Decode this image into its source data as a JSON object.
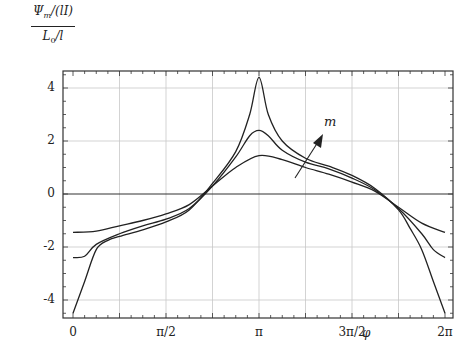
{
  "chart_data": {
    "type": "line",
    "title": "",
    "ylabel_numerator": "Ψm/(lI)",
    "ylabel_denominator": "L0/l",
    "xlabel": "φ",
    "xlim": [
      0,
      2
    ],
    "x_unit": "π",
    "ylim": [
      -4.7,
      4.7
    ],
    "grid": true,
    "x_ticks": [
      {
        "value": 0,
        "label": "0"
      },
      {
        "value": 0.5,
        "label": "π/2"
      },
      {
        "value": 1,
        "label": "π"
      },
      {
        "value": 1.5,
        "label": "3π/2"
      },
      {
        "value": 2,
        "label": "2π"
      }
    ],
    "x_gridlines": [
      0.25,
      0.5,
      0.75,
      1,
      1.25,
      1.5,
      1.75
    ],
    "y_ticks": [
      {
        "value": 4,
        "label": "4"
      },
      {
        "value": 2,
        "label": "2"
      },
      {
        "value": 0,
        "label": "0"
      },
      {
        "value": -2,
        "label": "-2"
      },
      {
        "value": -4,
        "label": "-4"
      }
    ],
    "annotation": {
      "text": "m",
      "meaning": "arrow indicating increasing m"
    },
    "series": [
      {
        "name": "m small",
        "x": [
          0,
          0.125,
          0.25,
          0.375,
          0.5,
          0.625,
          0.75,
          0.875,
          1.0,
          1.125,
          1.25,
          1.375,
          1.5,
          1.625,
          1.75,
          1.875,
          2.0
        ],
        "values": [
          -1.45,
          -1.4,
          -1.2,
          -1.0,
          -0.75,
          -0.4,
          0.3,
          1.0,
          1.45,
          1.3,
          1.0,
          0.75,
          0.45,
          0.1,
          -0.5,
          -1.1,
          -1.45
        ]
      },
      {
        "name": "m medium",
        "x": [
          0,
          0.0625,
          0.125,
          0.25,
          0.375,
          0.5,
          0.625,
          0.75,
          0.875,
          0.95,
          1.0,
          1.05,
          1.125,
          1.25,
          1.375,
          1.5,
          1.625,
          1.75,
          1.875,
          1.9375,
          2.0
        ],
        "values": [
          -2.4,
          -2.35,
          -1.9,
          -1.5,
          -1.2,
          -0.95,
          -0.55,
          0.3,
          1.4,
          2.2,
          2.4,
          2.2,
          1.65,
          1.2,
          0.95,
          0.6,
          0.15,
          -0.55,
          -1.5,
          -2.1,
          -2.4
        ]
      },
      {
        "name": "m large",
        "x": [
          0,
          0.0625,
          0.125,
          0.1875,
          0.25,
          0.375,
          0.5,
          0.625,
          0.75,
          0.875,
          0.95,
          1.0,
          1.05,
          1.125,
          1.25,
          1.375,
          1.5,
          1.625,
          1.75,
          1.8125,
          1.875,
          1.9375,
          2.0
        ],
        "values": [
          -4.5,
          -3.3,
          -2.1,
          -1.75,
          -1.6,
          -1.35,
          -1.05,
          -0.6,
          0.4,
          1.6,
          3.0,
          4.4,
          3.0,
          2.0,
          1.35,
          1.05,
          0.7,
          0.2,
          -0.6,
          -1.3,
          -2.1,
          -3.3,
          -4.5
        ]
      }
    ]
  },
  "labels": {
    "ylabel_num": "Ψm/(lI)",
    "ylabel_den": "L0/l",
    "xlabel": "φ",
    "arrow_label": "m"
  },
  "style": {
    "line_color": "#222222",
    "grid_color": "#c8c8c8",
    "frame_color": "#333333"
  }
}
